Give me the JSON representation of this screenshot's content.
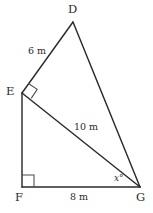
{
  "figure": {
    "canvas": {
      "width": 153,
      "height": 213
    },
    "stroke_color": "#2b2b2b",
    "background_color": "#ffffff",
    "vertices": [
      {
        "id": "D",
        "label": "D",
        "x": 73,
        "y": 22
      },
      {
        "id": "E",
        "label": "E",
        "x": 22,
        "y": 93
      },
      {
        "id": "F",
        "label": "F",
        "x": 22,
        "y": 187
      },
      {
        "id": "G",
        "label": "G",
        "x": 140,
        "y": 187
      }
    ],
    "edges": [
      {
        "id": "DE",
        "from": "D",
        "to": "E"
      },
      {
        "id": "DG",
        "from": "D",
        "to": "G"
      },
      {
        "id": "EF",
        "from": "E",
        "to": "F"
      },
      {
        "id": "EG",
        "from": "E",
        "to": "G"
      },
      {
        "id": "FG",
        "from": "F",
        "to": "G"
      }
    ],
    "side_labels": [
      {
        "id": "DE-length",
        "text": "6 m",
        "edge": "DE",
        "x": 28,
        "y": 46
      },
      {
        "id": "EG-length",
        "text": "10 m",
        "edge": "EG",
        "x": 74,
        "y": 122
      },
      {
        "id": "FG-length",
        "text": "8 m",
        "edge": "FG",
        "x": 70,
        "y": 192
      }
    ],
    "angle_labels": [
      {
        "id": "angle-x",
        "text": "x°",
        "at_vertex": "G",
        "x": 114,
        "y": 174
      }
    ],
    "right_angles": [
      {
        "id": "right-angle-E",
        "at_vertex": "E",
        "style": "rotated-square"
      },
      {
        "id": "right-angle-F",
        "at_vertex": "F",
        "style": "square"
      }
    ]
  }
}
